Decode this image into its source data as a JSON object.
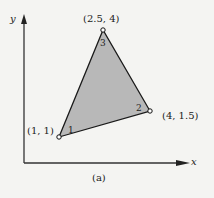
{
  "diagram": {
    "caption": "(a)",
    "axes": {
      "x_label": "x",
      "y_label": "y"
    },
    "fill_color": "#b8b8b8",
    "stroke_color": "#1a1a1a",
    "vertices": [
      {
        "number": "1",
        "coords": "(1, 1)"
      },
      {
        "number": "2",
        "coords": "(4, 1.5)"
      },
      {
        "number": "3",
        "coords": "(2.5, 4)"
      }
    ]
  }
}
